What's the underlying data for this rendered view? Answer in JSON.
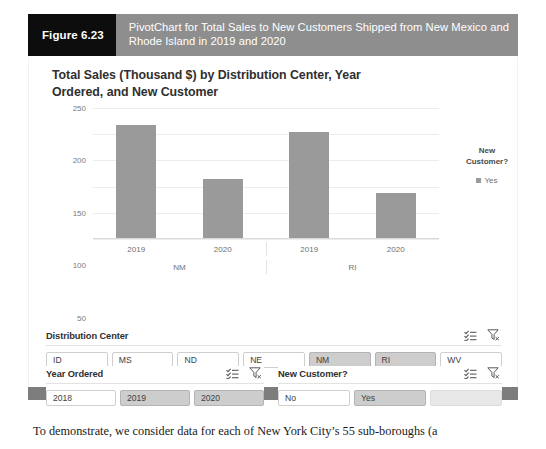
{
  "figure": {
    "label": "Figure 6.23",
    "caption": "PivotChart for Total Sales to New Customers Shipped from New Mexico and Rhode Island in 2019 and 2020"
  },
  "chart_data": {
    "type": "bar",
    "title": "Total Sales (Thousand $) by Distribution Center, Year Ordered, and New Customer",
    "xlabel": "",
    "ylabel": "",
    "ylim": [
      0,
      250
    ],
    "yticks": [
      0,
      50,
      100,
      150,
      200,
      250
    ],
    "grid": true,
    "legend_position": "right",
    "legend_title": "New Customer?",
    "legend_entries": [
      "Yes"
    ],
    "series": [
      {
        "name": "Yes",
        "values": [
          215,
          112,
          203,
          85
        ]
      }
    ],
    "categories": [
      "2019",
      "2020",
      "2019",
      "2020"
    ],
    "group_labels": [
      "NM",
      "RI"
    ],
    "bar_color": "#9a9a9a"
  },
  "slicers": [
    {
      "title": "Distribution Center",
      "multiselect_icon": "multi-select-icon",
      "clear_icon": "clear-filter-icon",
      "items": [
        {
          "label": "ID",
          "selected": false
        },
        {
          "label": "MS",
          "selected": false
        },
        {
          "label": "ND",
          "selected": false
        },
        {
          "label": "NE",
          "selected": false
        },
        {
          "label": "NM",
          "selected": true
        },
        {
          "label": "RI",
          "selected": true
        },
        {
          "label": "WV",
          "selected": false
        }
      ]
    },
    {
      "title": "Year Ordered",
      "multiselect_icon": "multi-select-icon",
      "clear_icon": "clear-filter-icon",
      "items": [
        {
          "label": "2018",
          "selected": false
        },
        {
          "label": "2019",
          "selected": true
        },
        {
          "label": "2020",
          "selected": true
        }
      ]
    },
    {
      "title": "New Customer?",
      "multiselect_icon": "multi-select-icon",
      "clear_icon": "clear-filter-icon",
      "items": [
        {
          "label": "No",
          "selected": false
        },
        {
          "label": "Yes",
          "selected": true
        },
        {
          "label": "",
          "selected": false,
          "blank": true
        }
      ]
    }
  ],
  "body": {
    "paragraph": "To demonstrate, we consider data for each of New York City’s 55 sub-boroughs (a"
  },
  "colors": {
    "caption_bar": "#8e8e8e",
    "caption_label": "#0d0d0d",
    "bar": "#9a9a9a",
    "slicer_selected": "#cdcdcd",
    "footer": "#7d7d7d"
  }
}
